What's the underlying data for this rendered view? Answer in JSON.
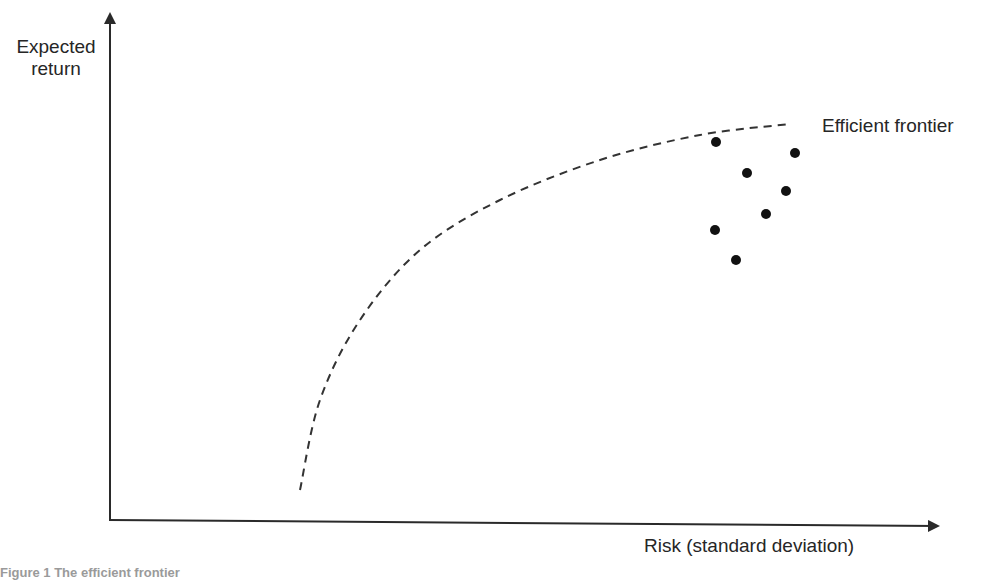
{
  "chart_data": {
    "type": "scatter",
    "title": "",
    "xlabel": "Risk (standard deviation)",
    "ylabel": "Expected return",
    "x_ticks": [],
    "y_ticks": [],
    "grid": false,
    "legend": null,
    "annotations": [
      {
        "text": "Efficient frontier",
        "position": "top-right, at end of dashed curve"
      }
    ],
    "series": [
      {
        "name": "Efficient frontier",
        "kind": "dashed-curve",
        "shape": "concave, rising steeply from lower-left then flattening toward upper-right",
        "points_px": [
          [
            300,
            490
          ],
          [
            320,
            400
          ],
          [
            360,
            320
          ],
          [
            420,
            250
          ],
          [
            500,
            200
          ],
          [
            600,
            160
          ],
          [
            700,
            135
          ],
          [
            790,
            124
          ]
        ]
      },
      {
        "name": "Portfolios",
        "kind": "points",
        "points_px": [
          [
            716,
            142
          ],
          [
            795,
            153
          ],
          [
            747,
            173
          ],
          [
            786,
            191
          ],
          [
            766,
            214
          ],
          [
            715,
            230
          ],
          [
            736,
            260
          ]
        ]
      }
    ],
    "axes": {
      "origin_px": [
        110,
        520
      ],
      "x_end_px": 940,
      "y_end_px": 12
    }
  },
  "labels": {
    "ylabel_line1": "Expected",
    "ylabel_line2": "return",
    "xlabel": "Risk (standard deviation)",
    "curve_label": "Efficient frontier",
    "caption": "Figure 1 The efficient frontier"
  },
  "colors": {
    "axis": "#2a2a2a",
    "curve": "#333333",
    "points": "#111111",
    "text": "#262626"
  }
}
